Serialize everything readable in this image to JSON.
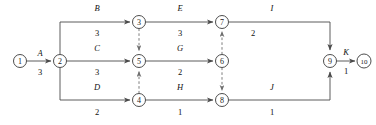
{
  "diagram": {
    "type": "aoa-network",
    "colors": {
      "background": "#ffffff",
      "node_stroke": "#3a3a3a",
      "edge_stroke": "#4a4a4a",
      "dummy_stroke": "#6e6e6e",
      "text": "#101010"
    },
    "nodes": [
      {
        "id": "n1",
        "label": "1",
        "x": 20,
        "y": 61,
        "r": 6.5
      },
      {
        "id": "n2",
        "label": "2",
        "x": 60,
        "y": 61,
        "r": 6.5
      },
      {
        "id": "n3",
        "label": "3",
        "x": 139,
        "y": 22,
        "r": 6.5
      },
      {
        "id": "n4",
        "label": "4",
        "x": 139,
        "y": 100,
        "r": 6.5
      },
      {
        "id": "n5",
        "label": "5",
        "x": 139,
        "y": 61,
        "r": 6.5
      },
      {
        "id": "n6",
        "label": "6",
        "x": 222,
        "y": 61,
        "r": 6.5
      },
      {
        "id": "n7",
        "label": "7",
        "x": 222,
        "y": 22,
        "r": 6.5
      },
      {
        "id": "n8",
        "label": "8",
        "x": 222,
        "y": 100,
        "r": 6.5
      },
      {
        "id": "n9",
        "label": "9",
        "x": 330,
        "y": 61,
        "r": 6.5
      },
      {
        "id": "n10",
        "label": "10",
        "x": 364,
        "y": 61,
        "r": 7.0
      }
    ],
    "edges": [
      {
        "id": "e-A",
        "from": "1",
        "to": "2",
        "name": "A",
        "duration": "3",
        "style": "solid",
        "path": "M 26.5 61 L 51 61",
        "name_x": 40,
        "name_y": 53,
        "dur_x": 40,
        "dur_y": 72
      },
      {
        "id": "e-B",
        "from": "2",
        "to": "3",
        "name": "B",
        "duration": "3",
        "style": "solid",
        "path": "M 60 54.5 L 60 22 L 130 22",
        "name_x": 97,
        "name_y": 8,
        "dur_x": 97,
        "dur_y": 33
      },
      {
        "id": "e-C",
        "from": "2",
        "to": "5",
        "name": "C",
        "duration": "3",
        "style": "solid",
        "path": "M 66.5 61 L 130 61",
        "name_x": 97,
        "name_y": 48,
        "dur_x": 97,
        "dur_y": 72
      },
      {
        "id": "e-D",
        "from": "2",
        "to": "4",
        "name": "D",
        "duration": "2",
        "style": "solid",
        "path": "M 60 67.5 L 60 100 L 130 100",
        "name_x": 97,
        "name_y": 87,
        "dur_x": 97,
        "dur_y": 112
      },
      {
        "id": "e-E",
        "from": "3",
        "to": "7",
        "name": "E",
        "duration": "3",
        "style": "solid",
        "path": "M 145.5 22 L 213 22",
        "name_x": 180,
        "name_y": 8,
        "dur_x": 180,
        "dur_y": 33
      },
      {
        "id": "e-G",
        "from": "5",
        "to": "6",
        "name": "G",
        "duration": "2",
        "style": "solid",
        "path": "M 145.5 61 L 213 61",
        "name_x": 180,
        "name_y": 48,
        "dur_x": 180,
        "dur_y": 72
      },
      {
        "id": "e-H",
        "from": "4",
        "to": "8",
        "name": "H",
        "duration": "1",
        "style": "solid",
        "path": "M 145.5 100 L 213 100",
        "name_x": 180,
        "name_y": 87,
        "dur_x": 180,
        "dur_y": 112
      },
      {
        "id": "e-I",
        "from": "7",
        "to": "9",
        "name": "I",
        "duration": "2",
        "style": "solid",
        "path": "M 228.5 22 L 330 22 L 330 50",
        "name_x": 272,
        "name_y": 8,
        "dur_x": 253,
        "dur_y": 33
      },
      {
        "id": "e-J",
        "from": "8",
        "to": "9",
        "name": "J",
        "duration": "1",
        "style": "solid",
        "path": "M 228.5 100 L 330 100 L 330 72",
        "name_x": 272,
        "name_y": 87,
        "dur_x": 272,
        "dur_y": 112
      },
      {
        "id": "e-K",
        "from": "9",
        "to": "10",
        "name": "K",
        "duration": "1",
        "style": "solid",
        "path": "M 336.5 61 L 355 61",
        "name_x": 346,
        "name_y": 52,
        "dur_x": 346,
        "dur_y": 71
      },
      {
        "id": "e-dummy-3-5",
        "from": "3",
        "to": "5",
        "name": "",
        "duration": "",
        "style": "dashed",
        "path": "M 139 28.5 L 139 51"
      },
      {
        "id": "e-dummy-4-5",
        "from": "4",
        "to": "5",
        "name": "",
        "duration": "",
        "style": "dashed",
        "path": "M 139 93.5 L 139 71"
      },
      {
        "id": "e-dummy-6-7",
        "from": "6",
        "to": "7",
        "name": "",
        "duration": "",
        "style": "dashed",
        "path": "M 222 54.5 L 222 31"
      },
      {
        "id": "e-dummy-6-8",
        "from": "6",
        "to": "8",
        "name": "",
        "duration": "",
        "style": "dashed",
        "path": "M 222 67.5 L 222 91"
      }
    ]
  }
}
